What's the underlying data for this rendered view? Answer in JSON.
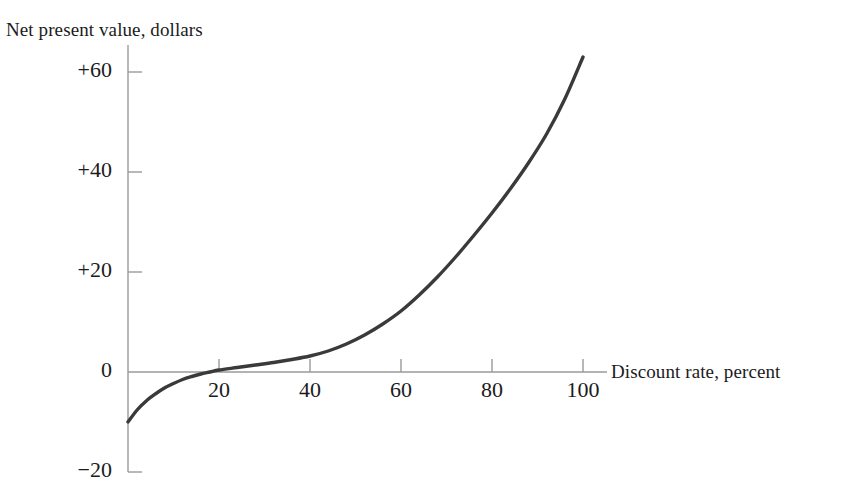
{
  "chart_data": {
    "type": "line",
    "title": "",
    "xlabel": "Discount rate, percent",
    "ylabel": "Net present value, dollars",
    "xlim": [
      0,
      104
    ],
    "ylim": [
      -20,
      65
    ],
    "grid": false,
    "legend": null,
    "x_ticks": [
      {
        "value": 20,
        "label": "20"
      },
      {
        "value": 40,
        "label": "40"
      },
      {
        "value": 60,
        "label": "60"
      },
      {
        "value": 80,
        "label": "80"
      },
      {
        "value": 100,
        "label": "100"
      }
    ],
    "y_ticks": [
      {
        "value": 60,
        "label": "+60"
      },
      {
        "value": 40,
        "label": "+40"
      },
      {
        "value": 20,
        "label": "+20"
      },
      {
        "value": 0,
        "label": "0"
      },
      {
        "value": -20,
        "label": "−20"
      }
    ],
    "series": [
      {
        "name": "Net present value",
        "color": "#3a3a3a",
        "x": [
          0,
          2,
          4,
          6,
          8,
          10,
          12,
          14,
          16,
          18,
          20,
          24,
          28,
          32,
          36,
          40,
          44,
          48,
          52,
          56,
          60,
          64,
          68,
          72,
          76,
          80,
          84,
          88,
          92,
          96,
          100
        ],
        "y": [
          -10.0,
          -7.6,
          -5.8,
          -4.4,
          -3.2,
          -2.3,
          -1.5,
          -0.9,
          -0.4,
          0.0,
          0.4,
          0.9,
          1.4,
          1.9,
          2.5,
          3.2,
          4.2,
          5.6,
          7.4,
          9.6,
          12.2,
          15.4,
          19.0,
          23.0,
          27.3,
          31.8,
          36.6,
          41.8,
          47.6,
          54.6,
          63.0
        ]
      }
    ],
    "axis_color": "#9a9a9a",
    "curve_color": "#3a3a3a",
    "background": "#ffffff"
  },
  "axes": {
    "y_axis_title": "Net present value, dollars",
    "x_axis_title": "Discount rate, percent"
  }
}
